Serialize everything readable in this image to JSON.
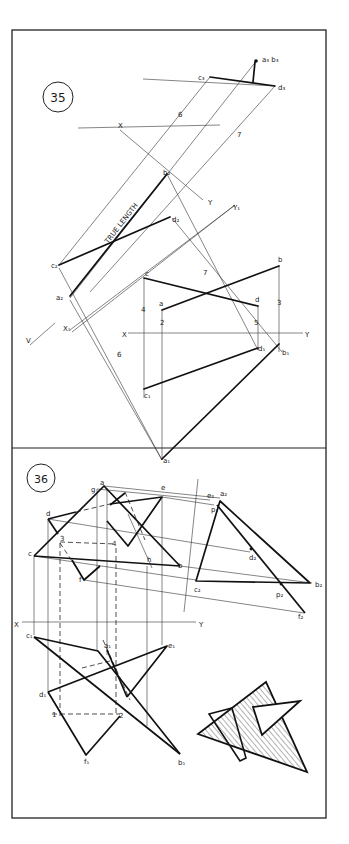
{
  "frame": {
    "x": 12,
    "y": 30,
    "w": 314,
    "h": 788,
    "divider_y": 448
  },
  "problem35": {
    "number": "35",
    "circle": {
      "cx": 58,
      "cy": 97,
      "r": 15
    },
    "true_length_label": "TRUE LENGTH",
    "true_length_pos": {
      "x": 128,
      "y": 218,
      "rot": -52
    },
    "thin_lines": [
      [
        59,
        301,
        210,
        77
      ],
      [
        82,
        321,
        275,
        86
      ],
      [
        88,
        298,
        233,
        210
      ],
      [
        120,
        117,
        223,
        200
      ],
      [
        69,
        370,
        118,
        345
      ],
      [
        225,
        195,
        255,
        178
      ],
      [
        150,
        133,
        250,
        395
      ],
      [
        160,
        128,
        276,
        408
      ],
      [
        243,
        105,
        193,
        193
      ],
      [
        59,
        301,
        78,
        307
      ],
      [
        70,
        320,
        162,
        470
      ],
      [
        144,
        77,
        144,
        189
      ],
      [
        162,
        112,
        162,
        460
      ],
      [
        255,
        86,
        255,
        145
      ],
      [
        279,
        67,
        279,
        145
      ],
      [
        279,
        145,
        279,
        178
      ],
      [
        258,
        145,
        258,
        148
      ],
      [
        144,
        170,
        144,
        189
      ],
      [
        162,
        112,
        162,
        133
      ],
      [
        128,
        135,
        308,
        135
      ]
    ],
    "thick_lines": [
      [
        210,
        77,
        275,
        86
      ],
      [
        255,
        62,
        253,
        82
      ],
      [
        70,
        96,
        167,
        174
      ],
      [
        59,
        65,
        170,
        67
      ],
      [
        144,
        77,
        258,
        106
      ],
      [
        162,
        110,
        279,
        67
      ],
      [
        144,
        189,
        258,
        148
      ],
      [
        162,
        459,
        279,
        144
      ],
      [
        59,
        65,
        258,
        106
      ]
    ],
    "labels": [
      {
        "t": "a₃ b₃",
        "x": 262,
        "y": 62
      },
      {
        "t": "c₃",
        "x": 198,
        "y": 80
      },
      {
        "t": "d₃",
        "x": 278,
        "y": 90
      },
      {
        "t": "6",
        "x": 178,
        "y": 117
      },
      {
        "t": "7",
        "x": 237,
        "y": 137
      },
      {
        "t": "X",
        "x": 118,
        "y": 128
      },
      {
        "t": "b₂",
        "x": 163,
        "y": 175
      },
      {
        "t": "Y",
        "x": 208,
        "y": 205
      },
      {
        "t": "Y₁",
        "x": 233,
        "y": 210
      },
      {
        "t": "d₂",
        "x": 172,
        "y": 222
      },
      {
        "t": "c₂",
        "x": 51,
        "y": 268
      },
      {
        "t": "c",
        "x": 145,
        "y": 276
      },
      {
        "t": "b",
        "x": 278,
        "y": 262
      },
      {
        "t": "7",
        "x": 203,
        "y": 275
      },
      {
        "t": "a",
        "x": 159,
        "y": 306
      },
      {
        "t": "d",
        "x": 255,
        "y": 302
      },
      {
        "t": "3",
        "x": 277,
        "y": 305
      },
      {
        "t": "a₂",
        "x": 56,
        "y": 300
      },
      {
        "t": "4",
        "x": 141,
        "y": 312
      },
      {
        "t": "2",
        "x": 160,
        "y": 325
      },
      {
        "t": "5",
        "x": 254,
        "y": 325
      },
      {
        "t": "X₁",
        "x": 63,
        "y": 331
      },
      {
        "t": "V",
        "x": 26,
        "y": 343
      },
      {
        "t": "X",
        "x": 122,
        "y": 337
      },
      {
        "t": "Y",
        "x": 305,
        "y": 337
      },
      {
        "t": "d₁",
        "x": 258,
        "y": 351
      },
      {
        "t": "b₁",
        "x": 282,
        "y": 355
      },
      {
        "t": "6",
        "x": 117,
        "y": 357
      },
      {
        "t": "c₁",
        "x": 144,
        "y": 398
      },
      {
        "t": "a₁",
        "x": 163,
        "y": 463
      }
    ]
  },
  "problem36": {
    "number": "36",
    "circle": {
      "cx": 41,
      "cy": 478,
      "r": 14
    },
    "labels": [
      {
        "t": "a",
        "x": 100,
        "y": 485
      },
      {
        "t": "g",
        "x": 91,
        "y": 492
      },
      {
        "t": "e",
        "x": 161,
        "y": 490
      },
      {
        "t": "d",
        "x": 46,
        "y": 516
      },
      {
        "t": "3",
        "x": 60,
        "y": 541
      },
      {
        "t": "4",
        "x": 112,
        "y": 546
      },
      {
        "t": "c",
        "x": 28,
        "y": 556
      },
      {
        "t": "h",
        "x": 147,
        "y": 562
      },
      {
        "t": "b",
        "x": 178,
        "y": 568
      },
      {
        "t": "f",
        "x": 79,
        "y": 582
      },
      {
        "t": "e₂",
        "x": 207,
        "y": 498
      },
      {
        "t": "a₂",
        "x": 220,
        "y": 496
      },
      {
        "t": "p₁",
        "x": 211,
        "y": 512
      },
      {
        "t": "d₂",
        "x": 249,
        "y": 560
      },
      {
        "t": "c₂",
        "x": 194,
        "y": 592
      },
      {
        "t": "b₂",
        "x": 315,
        "y": 587
      },
      {
        "t": "p₂",
        "x": 276,
        "y": 597
      },
      {
        "t": "f₂",
        "x": 298,
        "y": 619
      },
      {
        "t": "X",
        "x": 14,
        "y": 627
      },
      {
        "t": "Y",
        "x": 199,
        "y": 627
      },
      {
        "t": "c₁",
        "x": 26,
        "y": 638
      },
      {
        "t": "a₁",
        "x": 104,
        "y": 648
      },
      {
        "t": "e₁",
        "x": 168,
        "y": 648
      },
      {
        "t": "d₁",
        "x": 39,
        "y": 697
      },
      {
        "t": "1",
        "x": 52,
        "y": 717
      },
      {
        "t": "2",
        "x": 119,
        "y": 718
      },
      {
        "t": "f₁",
        "x": 84,
        "y": 764
      },
      {
        "t": "b₁",
        "x": 178,
        "y": 765
      }
    ],
    "auxiliary_line": {
      "x1": 198,
      "y1": 478,
      "x2": 184,
      "y2": 612
    },
    "xy_line": {
      "x1": 22,
      "y1": 622,
      "x2": 196,
      "y2": 622
    },
    "shaded_triangle_big": [
      [
        198,
        734
      ],
      [
        266,
        682
      ],
      [
        307,
        772
      ]
    ],
    "white_triangle_small": [
      [
        253,
        706
      ],
      [
        300,
        701
      ],
      [
        262,
        735
      ]
    ],
    "white_tab": [
      [
        210,
        716
      ],
      [
        230,
        708
      ],
      [
        238,
        758
      ]
    ]
  }
}
